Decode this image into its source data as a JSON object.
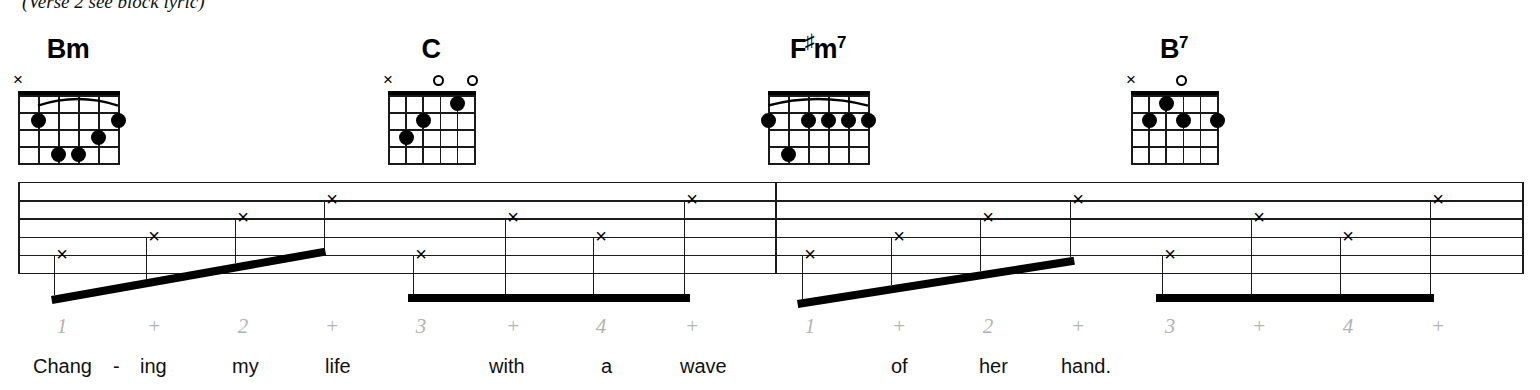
{
  "header": {
    "note": "(Verse 2 see block lyric)"
  },
  "chords": [
    {
      "id": "bm",
      "name": "Bm",
      "root": "B",
      "quality": "m",
      "superscript": "",
      "x": 18,
      "y": 40,
      "width": 100,
      "markers": [
        {
          "type": "x",
          "string": 6
        },
        {
          "type": "",
          "string": 5
        },
        {
          "type": "",
          "string": 4
        },
        {
          "type": "",
          "string": 3
        },
        {
          "type": "",
          "string": 2
        },
        {
          "type": "",
          "string": 1
        }
      ],
      "barre": {
        "fret": 1,
        "from_string": 5,
        "to_string": 1
      },
      "dots": [
        {
          "string": 5,
          "fret": 2
        },
        {
          "string": 1,
          "fret": 2
        },
        {
          "string": 2,
          "fret": 3
        },
        {
          "string": 4,
          "fret": 4
        },
        {
          "string": 3,
          "fret": 4
        }
      ]
    },
    {
      "id": "c",
      "name": "C",
      "root": "C",
      "quality": "",
      "superscript": "",
      "x": 388,
      "y": 40,
      "width": 86,
      "markers": [
        {
          "type": "x",
          "string": 6
        },
        {
          "type": "",
          "string": 5
        },
        {
          "type": "",
          "string": 4
        },
        {
          "type": "o",
          "string": 3
        },
        {
          "type": "",
          "string": 2
        },
        {
          "type": "o",
          "string": 1
        }
      ],
      "barre": null,
      "dots": [
        {
          "string": 5,
          "fret": 3
        },
        {
          "string": 4,
          "fret": 2
        },
        {
          "string": 2,
          "fret": 1
        }
      ]
    },
    {
      "id": "fsharpm7",
      "name": "F#m7",
      "root": "F",
      "quality": "m",
      "superscript": "7",
      "x": 768,
      "y": 40,
      "width": 100,
      "markers": [
        {
          "type": "",
          "string": 6
        },
        {
          "type": "",
          "string": 5
        },
        {
          "type": "",
          "string": 4
        },
        {
          "type": "",
          "string": 3
        },
        {
          "type": "",
          "string": 2
        },
        {
          "type": "",
          "string": 1
        }
      ],
      "barre": {
        "fret": 1,
        "from_string": 6,
        "to_string": 1
      },
      "dots": [
        {
          "string": 6,
          "fret": 2
        },
        {
          "string": 4,
          "fret": 2
        },
        {
          "string": 3,
          "fret": 2
        },
        {
          "string": 2,
          "fret": 2
        },
        {
          "string": 1,
          "fret": 2
        },
        {
          "string": 5,
          "fret": 4
        }
      ]
    },
    {
      "id": "b7",
      "name": "B7",
      "root": "B",
      "quality": "",
      "superscript": "7",
      "x": 1131,
      "y": 40,
      "width": 86,
      "markers": [
        {
          "type": "x",
          "string": 6
        },
        {
          "type": "",
          "string": 5
        },
        {
          "type": "",
          "string": 4
        },
        {
          "type": "o",
          "string": 3
        },
        {
          "type": "",
          "string": 2
        },
        {
          "type": "",
          "string": 1
        }
      ],
      "barre": null,
      "dots": [
        {
          "string": 4,
          "fret": 1
        },
        {
          "string": 5,
          "fret": 2
        },
        {
          "string": 3,
          "fret": 2
        },
        {
          "string": 1,
          "fret": 2
        }
      ]
    }
  ],
  "staff": {
    "lines": 6,
    "left": 18,
    "right": 1522,
    "top": 182,
    "line_gap": 18.2,
    "barlines": [
      18,
      775,
      1522
    ]
  },
  "notes": [
    {
      "beat": "1",
      "x": 62,
      "string": 5,
      "beam_group": 1
    },
    {
      "beat": "+",
      "x": 154,
      "string": 4,
      "beam_group": 1
    },
    {
      "beat": "2",
      "x": 243,
      "string": 3,
      "beam_group": 1
    },
    {
      "beat": "+",
      "x": 332,
      "string": 2,
      "beam_group": 1
    },
    {
      "beat": "3",
      "x": 421,
      "string": 5,
      "beam_group": 2
    },
    {
      "beat": "+",
      "x": 513,
      "string": 3,
      "beam_group": 2
    },
    {
      "beat": "4",
      "x": 601,
      "string": 4,
      "beam_group": 2
    },
    {
      "beat": "+",
      "x": 692,
      "string": 2,
      "beam_group": 2
    },
    {
      "beat": "1",
      "x": 810,
      "string": 5,
      "beam_group": 3
    },
    {
      "beat": "+",
      "x": 899,
      "string": 4,
      "beam_group": 3
    },
    {
      "beat": "2",
      "x": 988,
      "string": 3,
      "beam_group": 3
    },
    {
      "beat": "+",
      "x": 1078,
      "string": 2,
      "beam_group": 3
    },
    {
      "beat": "3",
      "x": 1170,
      "string": 5,
      "beam_group": 4
    },
    {
      "beat": "+",
      "x": 1259,
      "string": 3,
      "beam_group": 4
    },
    {
      "beat": "4",
      "x": 1348,
      "string": 4,
      "beam_group": 4
    },
    {
      "beat": "+",
      "x": 1438,
      "string": 2,
      "beam_group": 4
    }
  ],
  "beams": [
    {
      "group": 1,
      "x1": 59,
      "y1": 296,
      "x2": 325,
      "y2": 249
    },
    {
      "group": 2,
      "x1": 416,
      "y1": 294,
      "x2": 690,
      "y2": 294
    },
    {
      "group": 3,
      "x1": 805,
      "y1": 300,
      "x2": 1074,
      "y2": 258
    },
    {
      "group": 4,
      "x1": 1164,
      "y1": 294,
      "x2": 1434,
      "y2": 294
    }
  ],
  "counts": [
    {
      "label": "1",
      "x": 62
    },
    {
      "label": "+",
      "x": 154
    },
    {
      "label": "2",
      "x": 243
    },
    {
      "label": "+",
      "x": 332
    },
    {
      "label": "3",
      "x": 421
    },
    {
      "label": "+",
      "x": 513
    },
    {
      "label": "4",
      "x": 601
    },
    {
      "label": "+",
      "x": 692
    },
    {
      "label": "1",
      "x": 810
    },
    {
      "label": "+",
      "x": 899
    },
    {
      "label": "2",
      "x": 988
    },
    {
      "label": "+",
      "x": 1078
    },
    {
      "label": "3",
      "x": 1170
    },
    {
      "label": "+",
      "x": 1259
    },
    {
      "label": "4",
      "x": 1348
    },
    {
      "label": "+",
      "x": 1438
    }
  ],
  "lyrics": [
    {
      "text": "Chang",
      "x": 33
    },
    {
      "text": "-",
      "x": 113
    },
    {
      "text": "ing",
      "x": 140
    },
    {
      "text": "my",
      "x": 232
    },
    {
      "text": "life",
      "x": 325
    },
    {
      "text": "with",
      "x": 489
    },
    {
      "text": "a",
      "x": 601
    },
    {
      "text": "wave",
      "x": 680
    },
    {
      "text": "of",
      "x": 891
    },
    {
      "text": "her",
      "x": 979
    },
    {
      "text": "hand.",
      "x": 1061
    }
  ],
  "colors": {
    "ink": "#111111",
    "staff": "#1c1c1c",
    "count_gray": "#b3b3b3",
    "paper": "#ffffff"
  }
}
